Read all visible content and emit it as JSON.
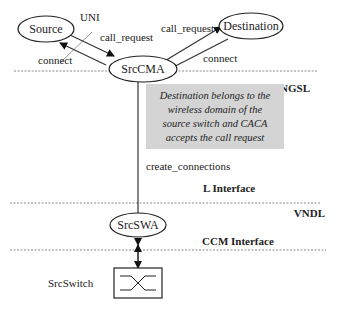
{
  "nodes": {
    "source": "Source",
    "destination": "Destination",
    "srccma": "SrcCMA",
    "srcswa": "SrcSWA",
    "srcswitch": "SrcSwitch"
  },
  "edges": {
    "uni": "UNI",
    "call_request_src": "call_request",
    "connect_src": "connect",
    "call_request_dst": "call_request",
    "connect_dst": "connect",
    "create_connections": "create_connections"
  },
  "layers": {
    "ngsl": "NGSL",
    "vndl": "VNDL",
    "l_interface": "L Interface",
    "ccm_interface": "CCM Interface"
  },
  "note": {
    "lines": [
      "Destination belongs to the",
      "wireless domain of the",
      "source switch and CACA",
      "accepts the call request"
    ],
    "fill": "#d4d4d4"
  }
}
